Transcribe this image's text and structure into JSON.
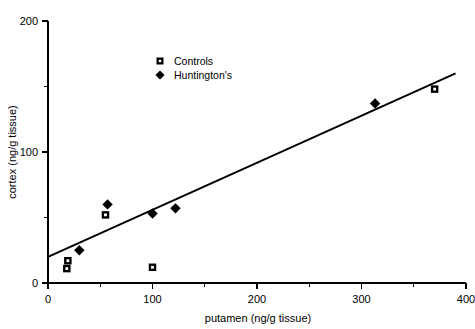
{
  "chart_data": {
    "type": "scatter",
    "title": "",
    "xlabel": "putamen (ng/g tissue)",
    "ylabel": "cortex (ng/g tissue)",
    "xlim": [
      0,
      400
    ],
    "ylim": [
      0,
      200
    ],
    "grid": false,
    "legend_position": "top-center",
    "x_major_ticks": [
      0,
      100,
      200,
      300,
      400
    ],
    "x_minor_ticks": [
      50,
      150,
      250,
      350
    ],
    "x_tick_labels": [
      "0",
      "100",
      "200",
      "300",
      "400"
    ],
    "y_major_ticks": [
      0,
      100,
      200
    ],
    "y_minor_ticks": [
      50,
      150
    ],
    "y_tick_labels": [
      "0",
      "100",
      "200"
    ],
    "series": [
      {
        "name": "Controls",
        "marker": "square",
        "color": "#000000",
        "points": [
          {
            "x": 18,
            "y": 11
          },
          {
            "x": 19,
            "y": 17
          },
          {
            "x": 55,
            "y": 52
          },
          {
            "x": 100,
            "y": 12
          },
          {
            "x": 370,
            "y": 148
          }
        ]
      },
      {
        "name": "Huntington's",
        "marker": "diamond",
        "color": "#000000",
        "points": [
          {
            "x": 30,
            "y": 25
          },
          {
            "x": 57,
            "y": 60
          },
          {
            "x": 100,
            "y": 53
          },
          {
            "x": 122,
            "y": 57
          },
          {
            "x": 313,
            "y": 137
          }
        ]
      }
    ],
    "fit_line": {
      "x_start": 0,
      "y_start": 20,
      "x_end": 390,
      "y_end": 160
    }
  },
  "legend": {
    "entries": [
      {
        "label": "Controls",
        "marker": "square"
      },
      {
        "label": "Huntington's",
        "marker": "diamond"
      }
    ]
  },
  "axes": {
    "x_title": "putamen (ng/g tissue)",
    "y_title": "cortex (ng/g tissue)"
  }
}
